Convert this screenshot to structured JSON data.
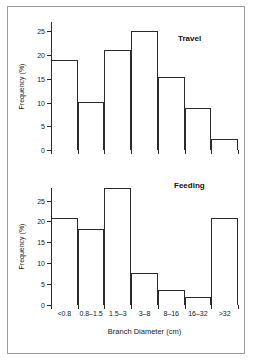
{
  "figure": {
    "xlabel": "Branch Diameter (cm)",
    "ylabel": "Frequency (%)"
  },
  "chart_data": [
    {
      "type": "bar",
      "title": "Travel",
      "xlabel": "Branch Diameter (cm)",
      "ylabel": "Frequency (%)",
      "categories": [
        "<0.8",
        "0.8–1.5",
        "1.5–3",
        "3–8",
        "8–16",
        "16–32",
        ">32"
      ],
      "values": [
        19.0,
        10.2,
        21.0,
        25.0,
        15.4,
        8.8,
        2.3
      ],
      "ylim": [
        0,
        27
      ],
      "yticks": [
        0,
        5,
        10,
        15,
        20,
        25
      ],
      "yticklabels": [
        "0",
        "5",
        "10",
        "15",
        "20",
        "25"
      ],
      "grid": false,
      "legend": "none"
    },
    {
      "type": "bar",
      "title": "Feeding",
      "xlabel": "Branch Diameter (cm)",
      "ylabel": "Frequency (%)",
      "categories": [
        "<0.8",
        "0.8–1.5",
        "1.5–3",
        "3–8",
        "8–16",
        "16–32",
        ">32"
      ],
      "values": [
        20.8,
        18.2,
        34.0,
        7.6,
        3.7,
        2.0,
        20.8
      ],
      "ylim": [
        0,
        28
      ],
      "yticks": [
        0,
        5,
        10,
        15,
        20,
        25
      ],
      "yticklabels": [
        "0",
        "5",
        "10",
        "15",
        "20",
        "25"
      ],
      "grid": false,
      "legend": "none"
    }
  ]
}
